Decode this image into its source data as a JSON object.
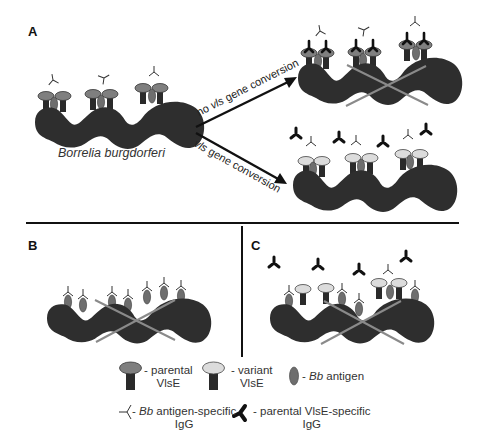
{
  "figure": {
    "panels": [
      {
        "id": "A",
        "label": "A"
      },
      {
        "id": "B",
        "label": "B"
      },
      {
        "id": "C",
        "label": "C"
      }
    ],
    "panel_a": {
      "organism_label": "Borrelia burgdorferi",
      "arrow_top_label_prefix": "no ",
      "arrow_top_label_gene": "vls",
      "arrow_top_label_suffix": " gene conversion",
      "arrow_bottom_label_gene": "vls",
      "arrow_bottom_label_suffix": " gene conversion"
    },
    "legend": {
      "parental_vlse": {
        "line1": "- parental",
        "line2": "VlsE"
      },
      "variant_vlse": {
        "line1": "- variant",
        "line2": "VlsE"
      },
      "bb_antigen": {
        "prefix": "- ",
        "italic": "Bb",
        "suffix": " antigen"
      },
      "bb_igg": {
        "prefix": "- ",
        "italic": "Bb",
        "suffix": " antigen-specific",
        "line2": "IgG"
      },
      "parental_igg": {
        "line1": "- parental VlsE-specific",
        "line2": "IgG"
      }
    },
    "colors": {
      "bacterium": "#2e2e2e",
      "parental_vlse_cap": "#7f7f7f",
      "variant_vlse_cap": "#d9d9d9",
      "antigen": "#6e6e6e",
      "cross": "#8a8a8a",
      "divider": "#111111"
    }
  }
}
